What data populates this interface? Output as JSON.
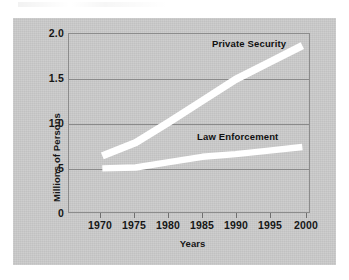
{
  "chart_data": {
    "type": "line",
    "title": "",
    "subtitle": "",
    "xlabel": "Years",
    "ylabel": "Millions of Persons",
    "x": [
      1970,
      1975,
      1980,
      1985,
      1990,
      1995,
      2000
    ],
    "xlim": [
      1965,
      2001
    ],
    "ylim": [
      0,
      2.0
    ],
    "ytick_labels": [
      "0",
      ".5",
      "1.0",
      "1.5",
      "2.0"
    ],
    "ytick_values": [
      0,
      0.5,
      1.0,
      1.5,
      2.0
    ],
    "xtick_labels": [
      "1970",
      "1975",
      "1980",
      "1985",
      "1990",
      "1995",
      "2000"
    ],
    "grid": "horizontal",
    "legend": "inline-labels",
    "line_color": "#ffffff",
    "plot_background": "#c9c9c9",
    "series": [
      {
        "name": "Private Security",
        "values": [
          0.63,
          0.78,
          1.01,
          1.25,
          1.49,
          1.68,
          1.87
        ]
      },
      {
        "name": "Law Enforcement",
        "values": [
          0.49,
          0.5,
          0.56,
          0.62,
          0.65,
          0.69,
          0.73
        ]
      }
    ]
  },
  "axis": {
    "y_title": "Millions of Persons",
    "x_title": "Years",
    "y_ticks": [
      "2.0",
      "1.5",
      "1.0",
      ".5",
      "0"
    ],
    "x_ticks": [
      "1970",
      "1975",
      "1980",
      "1985",
      "1990",
      "1995",
      "2000"
    ]
  },
  "labels": {
    "private_security": "Private Security",
    "law_enforcement": "Law Enforcement"
  }
}
